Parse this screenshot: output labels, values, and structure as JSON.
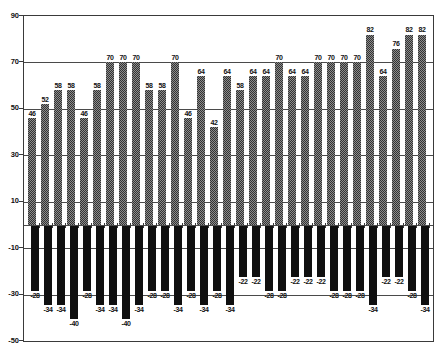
{
  "chart_data": {
    "type": "bar",
    "orientation": "vertical",
    "x_axis_labels": "none",
    "bar_count": 31,
    "series": [
      {
        "name": "upper-hatched-series",
        "style": "hatched-gray",
        "values": [
          46,
          52,
          58,
          58,
          46,
          58,
          70,
          70,
          70,
          58,
          58,
          70,
          46,
          64,
          42,
          64,
          58,
          64,
          64,
          70,
          64,
          64,
          70,
          70,
          70,
          70,
          82,
          64,
          76,
          82,
          82
        ]
      },
      {
        "name": "lower-solid-series",
        "style": "solid-black",
        "values": [
          -28,
          -34,
          -34,
          -40,
          -28,
          -34,
          -34,
          -40,
          -34,
          -28,
          -28,
          -34,
          -28,
          -34,
          -28,
          -34,
          -22,
          -22,
          -28,
          -28,
          -22,
          -22,
          -22,
          -28,
          -28,
          -28,
          -34,
          -22,
          -22,
          -28,
          -34
        ]
      }
    ],
    "ylim": [
      -50,
      90
    ],
    "yticks": [
      90,
      70,
      50,
      30,
      10,
      -10,
      -30,
      -50
    ],
    "grid": "horizontal",
    "legend": "none",
    "data_labels": "value shown at end of every bar",
    "zero_axis_ticks": "small plus marks along value 0 between bars",
    "colors": {
      "hatched_bar_dark": "#333333",
      "hatched_bar_light": "#8c8c8c",
      "solid_bar": "#101010",
      "line": "#3a3a3a",
      "label_text": "#111111",
      "background": "#ffffff"
    }
  }
}
